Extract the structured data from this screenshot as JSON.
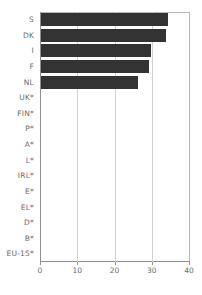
{
  "chart_data": {
    "type": "bar",
    "orientation": "horizontal",
    "title": "",
    "subtitle": "",
    "xlabel": "",
    "ylabel": "",
    "xlim": [
      0,
      40
    ],
    "xticks": [
      0,
      10,
      20,
      30,
      40
    ],
    "xtick_labels": [
      "0",
      "10",
      "20",
      "30",
      "40"
    ],
    "grid": true,
    "grid_axis": "x",
    "legend": false,
    "legend_position": "none",
    "categories": [
      "S",
      "DK",
      "I",
      "F",
      "NL",
      "UK*",
      "FIN*",
      "P*",
      "A*",
      "L*",
      "IRL*",
      "E*",
      "EL*",
      "D*",
      "B*",
      "EU-15*"
    ],
    "values": [
      34,
      33.5,
      29.5,
      29,
      26,
      0,
      0,
      0,
      0,
      0,
      0,
      0,
      0,
      0,
      0,
      0
    ],
    "bar_color": "#333333",
    "gridline_color": "#d2d2d2",
    "axis_color": "#8f8f8f",
    "label_color": "#6b6b6b",
    "background_color": "#ffffff"
  }
}
